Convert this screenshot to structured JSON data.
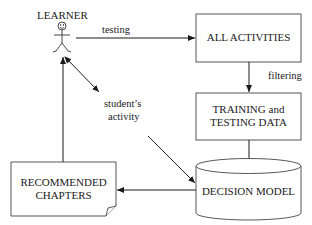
{
  "diagram": {
    "actor": {
      "label": "LEARNER"
    },
    "nodes": {
      "all_activities": {
        "label": "ALL ACTIVITIES"
      },
      "training_data": {
        "line1": "TRAINING and",
        "line2": "TESTING DATA"
      },
      "decision_model": {
        "label": "DECISION MODEL"
      },
      "recommended": {
        "line1": "RECOMMENDED",
        "line2": "CHAPTERS"
      }
    },
    "edges": {
      "testing": {
        "label": "testing"
      },
      "filtering": {
        "label": "filtering"
      },
      "student_activity": {
        "line1": "student’s",
        "line2": "activity"
      }
    }
  }
}
